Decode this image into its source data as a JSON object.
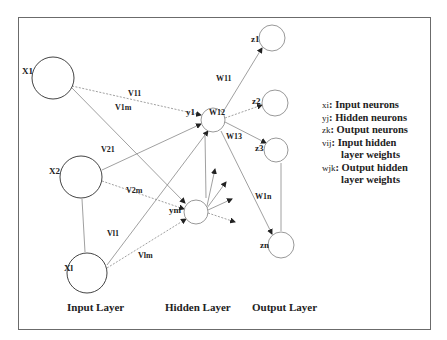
{
  "diagram": {
    "type": "neural-network",
    "layers": {
      "input": {
        "label": "Input Layer",
        "nodes": [
          "x1",
          "x2",
          "xl"
        ]
      },
      "hidden": {
        "label": "Hidden Layer",
        "nodes": [
          "y1",
          "ym"
        ]
      },
      "output": {
        "label": "Output Layer",
        "nodes": [
          "z1",
          "z2",
          "z3",
          "zn"
        ]
      }
    },
    "node_labels": {
      "x1": "X1",
      "x2": "X2",
      "xl": "Xl",
      "y1": "y1",
      "ym": "ym",
      "z1": "z1",
      "z2": "z2",
      "z3": "z3",
      "zn": "zn"
    },
    "weight_labels": {
      "v11": "V11",
      "v1m": "V1m",
      "v21": "V21",
      "v2m": "V2m",
      "vl1": "Vl1",
      "vlm": "Vlm",
      "w11": "W11",
      "w12": "W12",
      "w13": "W13",
      "w1n": "W1n"
    },
    "legend": [
      {
        "symbol": "xi",
        "text": ": Input neurons"
      },
      {
        "symbol": "yj",
        "text": ": Hidden neurons"
      },
      {
        "symbol": "zk",
        "text": ": Output neurons"
      },
      {
        "symbol": "vij",
        "text": ": Input hidden"
      },
      {
        "symbol": "",
        "text": "layer weights"
      },
      {
        "symbol": "wjk",
        "text": ": Output hidden"
      },
      {
        "symbol": "",
        "text": "layer weights"
      }
    ],
    "colors": {
      "line": "#7a7a7a",
      "node": "#555555",
      "arrow": "#222222",
      "frame": "#6b6b6b"
    }
  }
}
